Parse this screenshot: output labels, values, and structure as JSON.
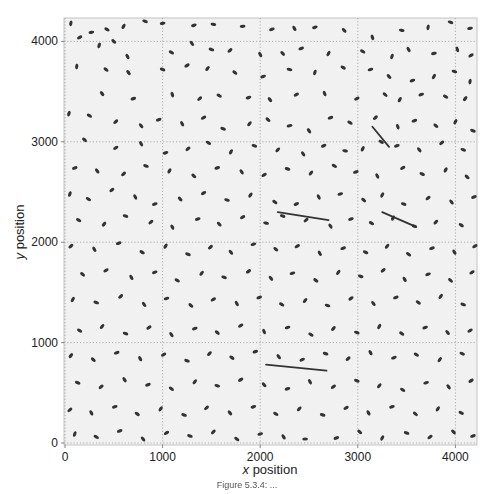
{
  "chart_data": {
    "type": "scatter",
    "title": "",
    "xlabel": "x position",
    "xlabel_italic_part": "x",
    "ylabel": "y position",
    "ylabel_italic_part": "y",
    "xlim": [
      0,
      4230
    ],
    "ylim": [
      0,
      4250
    ],
    "xticks": [
      0,
      1000,
      2000,
      3000,
      4000
    ],
    "yticks": [
      0,
      1000,
      2000,
      3000,
      4000
    ],
    "xtick_labels": [
      "0",
      "1000",
      "2000",
      "3000",
      "4000"
    ],
    "ytick_labels": [
      "0",
      "1000",
      "2000",
      "3000",
      "4000"
    ],
    "grid": true,
    "legend": null,
    "marker": "elongated ellipse (particle blob)",
    "colors": {
      "background": "#f1f1f1",
      "marker": "#333333",
      "grid": "#9a9a9a",
      "frame": "#bdbdbd"
    },
    "points": [
      [
        60,
        4180,
        80
      ],
      [
        270,
        4090,
        10
      ],
      [
        430,
        4120,
        -30
      ],
      [
        600,
        4150,
        60
      ],
      [
        820,
        4200,
        -20
      ],
      [
        1000,
        4180,
        10
      ],
      [
        1320,
        4160,
        15
      ],
      [
        1520,
        4170,
        -10
      ],
      [
        1820,
        4150,
        5
      ],
      [
        2120,
        4120,
        20
      ],
      [
        2350,
        4130,
        -60
      ],
      [
        2560,
        4140,
        15
      ],
      [
        2860,
        4110,
        -45
      ],
      [
        3150,
        4040,
        -70
      ],
      [
        3450,
        4110,
        -10
      ],
      [
        3720,
        4140,
        80
      ],
      [
        3950,
        4190,
        -20
      ],
      [
        4150,
        4130,
        10
      ],
      [
        150,
        4040,
        30
      ],
      [
        350,
        3960,
        70
      ],
      [
        500,
        4000,
        -40
      ],
      [
        640,
        3850,
        -60
      ],
      [
        1090,
        3890,
        -30
      ],
      [
        1300,
        3980,
        -55
      ],
      [
        1500,
        3920,
        -20
      ],
      [
        1690,
        3910,
        40
      ],
      [
        2000,
        3870,
        -60
      ],
      [
        2230,
        3880,
        -45
      ],
      [
        2420,
        3930,
        20
      ],
      [
        2700,
        3880,
        60
      ],
      [
        3050,
        3900,
        -30
      ],
      [
        3350,
        3850,
        70
      ],
      [
        3520,
        3920,
        -60
      ],
      [
        3780,
        3880,
        10
      ],
      [
        4020,
        3920,
        -70
      ],
      [
        4160,
        3860,
        30
      ],
      [
        120,
        3750,
        80
      ],
      [
        420,
        3720,
        -40
      ],
      [
        650,
        3690,
        -55
      ],
      [
        1000,
        3720,
        -20
      ],
      [
        1250,
        3760,
        30
      ],
      [
        1460,
        3730,
        50
      ],
      [
        1740,
        3690,
        -40
      ],
      [
        2030,
        3650,
        20
      ],
      [
        2300,
        3720,
        -10
      ],
      [
        2560,
        3690,
        70
      ],
      [
        2850,
        3740,
        -30
      ],
      [
        3130,
        3720,
        15
      ],
      [
        3320,
        3650,
        -45
      ],
      [
        3560,
        3610,
        20
      ],
      [
        3780,
        3650,
        60
      ],
      [
        3990,
        3700,
        -15
      ],
      [
        4150,
        3600,
        80
      ],
      [
        380,
        3480,
        -50
      ],
      [
        700,
        3430,
        20
      ],
      [
        1100,
        3470,
        -70
      ],
      [
        1380,
        3430,
        40
      ],
      [
        1580,
        3460,
        -30
      ],
      [
        1880,
        3440,
        15
      ],
      [
        2100,
        3420,
        -50
      ],
      [
        2370,
        3470,
        30
      ],
      [
        2660,
        3480,
        -65
      ],
      [
        2990,
        3430,
        25
      ],
      [
        3280,
        3470,
        -40
      ],
      [
        3430,
        3420,
        60
      ],
      [
        3650,
        3470,
        20
      ],
      [
        3900,
        3450,
        -30
      ],
      [
        4100,
        3430,
        50
      ],
      [
        40,
        3280,
        70
      ],
      [
        250,
        3260,
        -30
      ],
      [
        520,
        3200,
        40
      ],
      [
        780,
        3160,
        -50
      ],
      [
        960,
        3220,
        20
      ],
      [
        1200,
        3180,
        -60
      ],
      [
        1420,
        3240,
        30
      ],
      [
        1620,
        3130,
        -20
      ],
      [
        1890,
        3180,
        50
      ],
      [
        2080,
        3220,
        -40
      ],
      [
        2300,
        3160,
        10
      ],
      [
        2500,
        3110,
        -55
      ],
      [
        2720,
        3240,
        20
      ],
      [
        2920,
        3190,
        -30
      ],
      [
        3180,
        3240,
        40
      ],
      [
        3410,
        3150,
        -70
      ],
      [
        3580,
        3210,
        20
      ],
      [
        3800,
        3160,
        -40
      ],
      [
        4000,
        3200,
        60
      ],
      [
        4180,
        3110,
        -20
      ],
      [
        200,
        3020,
        -40
      ],
      [
        520,
        2940,
        30
      ],
      [
        780,
        2980,
        -60
      ],
      [
        1030,
        2890,
        15
      ],
      [
        1260,
        2930,
        40
      ],
      [
        1470,
        2990,
        -30
      ],
      [
        1700,
        2900,
        60
      ],
      [
        1940,
        2960,
        -20
      ],
      [
        2180,
        2920,
        45
      ],
      [
        2440,
        2880,
        -55
      ],
      [
        2650,
        2960,
        25
      ],
      [
        2870,
        2910,
        -10
      ],
      [
        3050,
        2930,
        60
      ],
      [
        3240,
        3000,
        -30
      ],
      [
        3400,
        2960,
        20
      ],
      [
        3630,
        2920,
        -50
      ],
      [
        3860,
        2990,
        40
      ],
      [
        4080,
        2920,
        -20
      ],
      [
        100,
        2740,
        20
      ],
      [
        330,
        2710,
        -50
      ],
      [
        600,
        2680,
        40
      ],
      [
        830,
        2760,
        -20
      ],
      [
        1070,
        2710,
        60
      ],
      [
        1320,
        2660,
        -40
      ],
      [
        1560,
        2740,
        15
      ],
      [
        1810,
        2700,
        -55
      ],
      [
        2040,
        2670,
        30
      ],
      [
        2280,
        2730,
        -15
      ],
      [
        2520,
        2690,
        50
      ],
      [
        2760,
        2760,
        -30
      ],
      [
        2980,
        2700,
        20
      ],
      [
        3200,
        2660,
        -60
      ],
      [
        3460,
        2740,
        30
      ],
      [
        3660,
        2680,
        -25
      ],
      [
        3900,
        2720,
        60
      ],
      [
        4120,
        2650,
        -40
      ],
      [
        50,
        2480,
        70
      ],
      [
        240,
        2430,
        -30
      ],
      [
        480,
        2520,
        40
      ],
      [
        720,
        2450,
        -60
      ],
      [
        920,
        2380,
        20
      ],
      [
        1180,
        2430,
        -45
      ],
      [
        1420,
        2490,
        30
      ],
      [
        1660,
        2420,
        -15
      ],
      [
        1900,
        2470,
        55
      ],
      [
        2150,
        2400,
        -35
      ],
      [
        2370,
        2380,
        25
      ],
      [
        2600,
        2450,
        -60
      ],
      [
        2820,
        2480,
        15
      ],
      [
        3060,
        2420,
        -40
      ],
      [
        3250,
        2470,
        60
      ],
      [
        3470,
        2380,
        -20
      ],
      [
        3720,
        2440,
        40
      ],
      [
        3960,
        2400,
        -50
      ],
      [
        4190,
        2450,
        20
      ],
      [
        140,
        2220,
        -30
      ],
      [
        400,
        2180,
        50
      ],
      [
        620,
        2260,
        -20
      ],
      [
        880,
        2200,
        40
      ],
      [
        1100,
        2150,
        -60
      ],
      [
        1360,
        2230,
        20
      ],
      [
        1580,
        2180,
        -45
      ],
      [
        1820,
        2250,
        30
      ],
      [
        2060,
        2190,
        -10
      ],
      [
        2230,
        2260,
        -20
      ],
      [
        2470,
        2220,
        40
      ],
      [
        2720,
        2160,
        -55
      ],
      [
        2930,
        2230,
        20
      ],
      [
        3140,
        2190,
        -30
      ],
      [
        3360,
        2240,
        60
      ],
      [
        3580,
        2160,
        -20
      ],
      [
        3800,
        2200,
        45
      ],
      [
        4060,
        2170,
        -35
      ],
      [
        60,
        1960,
        40
      ],
      [
        300,
        1930,
        -60
      ],
      [
        550,
        1990,
        20
      ],
      [
        790,
        1900,
        -30
      ],
      [
        1030,
        1960,
        55
      ],
      [
        1260,
        1880,
        -20
      ],
      [
        1490,
        1950,
        40
      ],
      [
        1700,
        1900,
        -50
      ],
      [
        1930,
        1980,
        15
      ],
      [
        2160,
        1930,
        -40
      ],
      [
        2380,
        1960,
        30
      ],
      [
        2610,
        1890,
        -60
      ],
      [
        2850,
        1940,
        20
      ],
      [
        3080,
        1900,
        -25
      ],
      [
        3300,
        1960,
        50
      ],
      [
        3520,
        1880,
        -35
      ],
      [
        3760,
        1940,
        20
      ],
      [
        3990,
        1900,
        -55
      ],
      [
        4200,
        1960,
        30
      ],
      [
        180,
        1680,
        -40
      ],
      [
        420,
        1720,
        30
      ],
      [
        680,
        1650,
        -60
      ],
      [
        920,
        1700,
        20
      ],
      [
        1150,
        1620,
        -30
      ],
      [
        1400,
        1690,
        50
      ],
      [
        1630,
        1650,
        -20
      ],
      [
        1880,
        1710,
        35
      ],
      [
        2110,
        1640,
        -50
      ],
      [
        2330,
        1690,
        15
      ],
      [
        2570,
        1620,
        -35
      ],
      [
        2800,
        1700,
        55
      ],
      [
        3030,
        1660,
        -15
      ],
      [
        3260,
        1720,
        40
      ],
      [
        3480,
        1630,
        -60
      ],
      [
        3720,
        1680,
        20
      ],
      [
        3950,
        1620,
        -40
      ],
      [
        4170,
        1700,
        30
      ],
      [
        80,
        1430,
        60
      ],
      [
        320,
        1400,
        -20
      ],
      [
        570,
        1460,
        40
      ],
      [
        810,
        1380,
        -55
      ],
      [
        1040,
        1440,
        15
      ],
      [
        1290,
        1370,
        -40
      ],
      [
        1520,
        1430,
        30
      ],
      [
        1760,
        1390,
        -60
      ],
      [
        1990,
        1450,
        20
      ],
      [
        2220,
        1380,
        -30
      ],
      [
        2460,
        1420,
        50
      ],
      [
        2690,
        1370,
        -15
      ],
      [
        2930,
        1440,
        35
      ],
      [
        3160,
        1390,
        -50
      ],
      [
        3390,
        1450,
        20
      ],
      [
        3620,
        1400,
        -35
      ],
      [
        3850,
        1460,
        55
      ],
      [
        4080,
        1380,
        -20
      ],
      [
        150,
        1120,
        -30
      ],
      [
        380,
        1160,
        50
      ],
      [
        620,
        1090,
        -20
      ],
      [
        860,
        1150,
        35
      ],
      [
        1090,
        1080,
        -55
      ],
      [
        1330,
        1140,
        20
      ],
      [
        1560,
        1100,
        -40
      ],
      [
        1800,
        1170,
        30
      ],
      [
        2040,
        1110,
        -65
      ],
      [
        2280,
        1150,
        15
      ],
      [
        2520,
        1080,
        -30
      ],
      [
        2750,
        1140,
        45
      ],
      [
        2990,
        1100,
        -20
      ],
      [
        3220,
        1160,
        60
      ],
      [
        3450,
        1090,
        -35
      ],
      [
        3690,
        1150,
        20
      ],
      [
        3920,
        1100,
        -50
      ],
      [
        4150,
        1120,
        30
      ],
      [
        60,
        870,
        50
      ],
      [
        290,
        830,
        -40
      ],
      [
        530,
        900,
        20
      ],
      [
        770,
        840,
        -60
      ],
      [
        1010,
        880,
        30
      ],
      [
        1250,
        820,
        -20
      ],
      [
        1480,
        890,
        45
      ],
      [
        1710,
        850,
        -35
      ],
      [
        1950,
        910,
        15
      ],
      [
        2190,
        860,
        -50
      ],
      [
        2430,
        830,
        25
      ],
      [
        2670,
        890,
        -15
      ],
      [
        2900,
        840,
        40
      ],
      [
        3130,
        900,
        -60
      ],
      [
        3370,
        850,
        20
      ],
      [
        3600,
        880,
        -30
      ],
      [
        3840,
        830,
        55
      ],
      [
        4070,
        890,
        -25
      ],
      [
        130,
        600,
        -20
      ],
      [
        370,
        560,
        40
      ],
      [
        610,
        630,
        -55
      ],
      [
        850,
        580,
        20
      ],
      [
        1090,
        540,
        -35
      ],
      [
        1330,
        610,
        50
      ],
      [
        1560,
        570,
        -15
      ],
      [
        1800,
        630,
        30
      ],
      [
        2040,
        580,
        -45
      ],
      [
        2280,
        540,
        20
      ],
      [
        2510,
        610,
        -60
      ],
      [
        2750,
        560,
        35
      ],
      [
        2990,
        620,
        -20
      ],
      [
        3220,
        570,
        50
      ],
      [
        3460,
        530,
        -30
      ],
      [
        3700,
        600,
        15
      ],
      [
        3930,
        560,
        -55
      ],
      [
        4160,
        620,
        30
      ],
      [
        50,
        330,
        40
      ],
      [
        270,
        300,
        -60
      ],
      [
        510,
        360,
        20
      ],
      [
        740,
        290,
        -35
      ],
      [
        980,
        340,
        55
      ],
      [
        1220,
        280,
        -20
      ],
      [
        1450,
        350,
        40
      ],
      [
        1690,
        300,
        -50
      ],
      [
        1930,
        360,
        15
      ],
      [
        2160,
        290,
        -30
      ],
      [
        2400,
        340,
        45
      ],
      [
        2640,
        280,
        -15
      ],
      [
        2880,
        350,
        30
      ],
      [
        3110,
        300,
        -60
      ],
      [
        3350,
        360,
        20
      ],
      [
        3590,
        290,
        -40
      ],
      [
        3820,
        340,
        55
      ],
      [
        4060,
        300,
        -25
      ],
      [
        100,
        90,
        70
      ],
      [
        320,
        60,
        -30
      ],
      [
        560,
        120,
        20
      ],
      [
        800,
        40,
        -50
      ],
      [
        1040,
        100,
        30
      ],
      [
        1280,
        70,
        -20
      ],
      [
        1520,
        110,
        45
      ],
      [
        1760,
        40,
        -35
      ],
      [
        2000,
        90,
        15
      ],
      [
        2240,
        60,
        -55
      ],
      [
        2460,
        40,
        0
      ],
      [
        2780,
        50,
        20
      ],
      [
        3020,
        110,
        -40
      ],
      [
        3250,
        50,
        60
      ],
      [
        3500,
        100,
        -20
      ],
      [
        3740,
        60,
        35
      ],
      [
        3980,
        110,
        -45
      ],
      [
        4180,
        70,
        20
      ]
    ],
    "streaks": [
      {
        "x": [
          2180,
          2700
        ],
        "y": [
          2300,
          2220
        ],
        "label": "elongated streak"
      },
      {
        "x": [
          2060,
          2680
        ],
        "y": [
          780,
          720
        ],
        "label": "elongated streak"
      },
      {
        "x": [
          3150,
          3320
        ],
        "y": [
          3150,
          2950
        ],
        "label": "elongated streak"
      },
      {
        "x": [
          3250,
          3580
        ],
        "y": [
          2300,
          2160
        ],
        "label": "elongated streak"
      }
    ]
  },
  "caption": "Figure 5.3.4: ..."
}
